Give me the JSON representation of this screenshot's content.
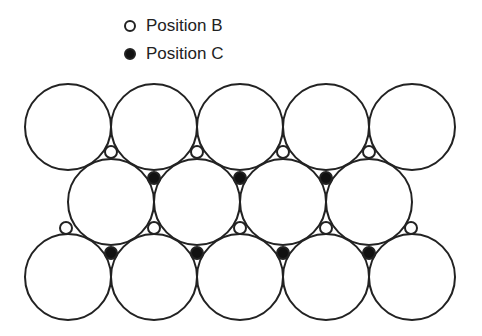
{
  "legend": {
    "items": [
      {
        "label": "Position B",
        "marker": "open-circle"
      },
      {
        "label": "Position C",
        "marker": "filled-circle"
      }
    ]
  },
  "diagram": {
    "large_radius": 43,
    "small_radius": 6,
    "stroke_color": "#222222",
    "fill_c": "#111111",
    "large_circles": [
      [
        68,
        127
      ],
      [
        154,
        127
      ],
      [
        240,
        127
      ],
      [
        326,
        127
      ],
      [
        412,
        127
      ],
      [
        111,
        202
      ],
      [
        197,
        202
      ],
      [
        283,
        202
      ],
      [
        369,
        202
      ],
      [
        68,
        277
      ],
      [
        154,
        277
      ],
      [
        240,
        277
      ],
      [
        326,
        277
      ],
      [
        412,
        277
      ]
    ],
    "b_sites": [
      [
        111,
        152
      ],
      [
        197,
        152
      ],
      [
        283,
        152
      ],
      [
        369,
        152
      ],
      [
        66,
        228
      ],
      [
        154,
        228
      ],
      [
        240,
        228
      ],
      [
        326,
        228
      ],
      [
        411,
        228
      ]
    ],
    "c_sites": [
      [
        154,
        178
      ],
      [
        240,
        178
      ],
      [
        326,
        178
      ],
      [
        111,
        253
      ],
      [
        197,
        253
      ],
      [
        283,
        253
      ],
      [
        369,
        253
      ]
    ]
  }
}
